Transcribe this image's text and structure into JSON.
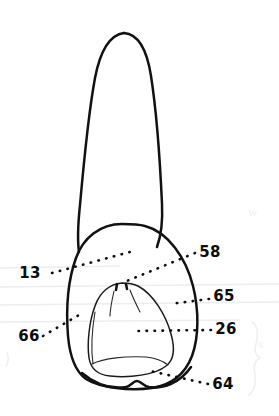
{
  "figure": {
    "kind": "anatomical-line-drawing",
    "background_color": "#ffffff",
    "ink_color": "#111111",
    "width": 279,
    "height": 416
  },
  "labels": [
    {
      "id": "13",
      "text": "13",
      "side": "left",
      "text_x": 30,
      "text_y": 278,
      "leader_start_x": 52,
      "leader_start_y": 273,
      "leader_end_x": 130,
      "leader_end_y": 252
    },
    {
      "id": "58",
      "text": "58",
      "side": "right",
      "text_x": 198,
      "text_y": 257,
      "leader_start_x": 195,
      "leader_start_y": 253,
      "leader_end_x": 122,
      "leader_end_y": 283
    },
    {
      "id": "65",
      "text": "65",
      "side": "right",
      "text_x": 212,
      "text_y": 301,
      "leader_start_x": 209,
      "leader_start_y": 297,
      "leader_end_x": 170,
      "leader_end_y": 303
    },
    {
      "id": "26",
      "text": "26",
      "side": "right",
      "text_x": 214,
      "text_y": 333,
      "leader_start_x": 211,
      "leader_start_y": 328,
      "leader_end_x": 134,
      "leader_end_y": 330
    },
    {
      "id": "66",
      "text": "66",
      "side": "left",
      "text_x": 20,
      "text_y": 340,
      "leader_start_x": 43,
      "leader_start_y": 334,
      "leader_end_x": 84,
      "leader_end_y": 312
    },
    {
      "id": "64",
      "text": "64",
      "side": "right",
      "text_x": 211,
      "text_y": 388,
      "leader_start_x": 208,
      "leader_start_y": 383,
      "leader_end_x": 150,
      "leader_end_y": 370
    }
  ],
  "ghost_marks": {
    "scribble_upper": "w",
    "scribble_lower": "s",
    "brace": "}"
  }
}
